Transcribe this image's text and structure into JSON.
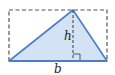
{
  "diagram": {
    "labels": {
      "height": "h",
      "base": "b"
    },
    "colors": {
      "fill": "#d3e3f5",
      "edge": "#4a7fc4",
      "dashed": "#555555",
      "text": "#222222"
    },
    "shapes": {
      "triangle": {
        "points": [
          [
            9,
            61
          ],
          [
            73,
            10
          ],
          [
            107,
            61
          ]
        ]
      },
      "bounding_rectangle": {
        "x": 9,
        "y": 10,
        "width": 98,
        "height": 51,
        "style": "dashed"
      },
      "height_line": {
        "x": 73,
        "y1": 10,
        "y2": 61,
        "style": "dashed"
      },
      "right_angle_marker": {
        "x": 73,
        "y": 54,
        "size": 7
      }
    }
  }
}
